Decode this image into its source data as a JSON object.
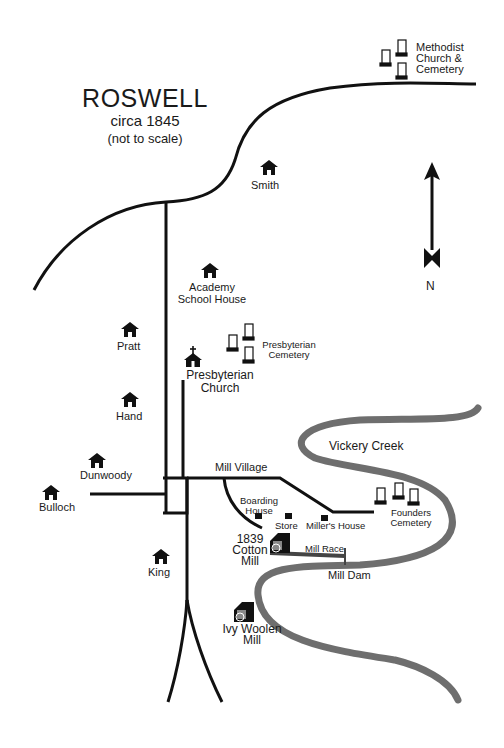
{
  "title": {
    "name": "ROSWELL",
    "date": "circa 1845",
    "note": "(not to scale)"
  },
  "compass": {
    "label": "N"
  },
  "landmarks": {
    "methodist": [
      "Methodist",
      "Church &",
      "Cemetery"
    ],
    "smith": "Smith",
    "academy": [
      "Academy",
      "School House"
    ],
    "pratt": "Pratt",
    "presbyterian_church": [
      "Presbyterian",
      "Church"
    ],
    "presbyterian_cemetery": [
      "Presbyterian",
      "Cemetery"
    ],
    "hand": "Hand",
    "dunwoody": "Dunwoody",
    "bulloch": "Bulloch",
    "king": "King",
    "mill_village": "Mill Village",
    "boarding_house": [
      "Boarding",
      "House"
    ],
    "store": "Store",
    "millers_house": "Miller's House",
    "founders_cemetery": [
      "Founders",
      "Cemetery"
    ],
    "cotton_mill": [
      "1839",
      "Cotton",
      "Mill"
    ],
    "mill_race": "Mill Race",
    "mill_dam": "Mill Dam",
    "ivy_woolen_mill": [
      "Ivy Woolen",
      "Mill"
    ],
    "vickery_creek": "Vickery Creek"
  },
  "colors": {
    "road": "#111111",
    "creek": "#6e6e6e",
    "background": "#ffffff"
  }
}
